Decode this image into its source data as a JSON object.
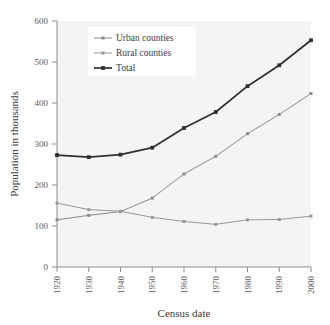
{
  "chart_data": {
    "type": "line",
    "title": "",
    "xlabel": "Census date",
    "ylabel": "Population in thousands",
    "categories": [
      "1920",
      "1930",
      "1940",
      "1950",
      "1960",
      "1970",
      "1980",
      "1990",
      "2000"
    ],
    "x": [
      1920,
      1930,
      1940,
      1950,
      1960,
      1970,
      1980,
      1990,
      2000
    ],
    "xlim": [
      1920,
      2000
    ],
    "ylim": [
      0,
      600
    ],
    "yticks": [
      0,
      100,
      200,
      300,
      400,
      500,
      600
    ],
    "ytick_labels": [
      "0",
      "100",
      "200",
      "300",
      "400",
      "500",
      "600"
    ],
    "xtick_labels": [
      "1920",
      "1930",
      "1940",
      "1950",
      "1960",
      "1970",
      "1980",
      "1990",
      "2000"
    ],
    "grid": false,
    "legend_position": "upper left",
    "series": [
      {
        "name": "Urban counties",
        "color": "#8a8a8a",
        "marker": "square",
        "values": [
          115,
          126,
          135,
          168,
          227,
          270,
          325,
          372,
          423
        ]
      },
      {
        "name": "Rural counties",
        "color": "#989898",
        "marker": "square",
        "values": [
          156,
          140,
          136,
          121,
          111,
          104,
          115,
          116,
          124
        ]
      },
      {
        "name": "Total",
        "color": "#2f2f2f",
        "marker": "square",
        "values": [
          273,
          268,
          274,
          291,
          339,
          378,
          441,
          492,
          553
        ]
      }
    ]
  },
  "axes": {
    "x_title": "Census date",
    "y_title": "Population in thousands"
  },
  "legend": {
    "entries": [
      {
        "label": "Urban counties"
      },
      {
        "label": "Rural counties"
      },
      {
        "label": "Total"
      }
    ]
  },
  "colors": {
    "plot_background": "#f4f4f4",
    "axis": "#8d8d8d",
    "text": "#3d3d3d",
    "urban": "#8a8a8a",
    "rural": "#989898",
    "total": "#2f2f2f"
  }
}
